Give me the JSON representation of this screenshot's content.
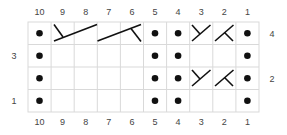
{
  "chart": {
    "type": "knitting-chart",
    "columns": 10,
    "rows": 4,
    "column_labels": [
      "10",
      "9",
      "8",
      "7",
      "6",
      "5",
      "4",
      "3",
      "2",
      "1"
    ],
    "row_labels": {
      "right": [
        {
          "row": 4,
          "label": "4"
        },
        {
          "row": 2,
          "label": "2"
        }
      ],
      "left": [
        {
          "row": 3,
          "label": "3"
        },
        {
          "row": 1,
          "label": "1"
        }
      ]
    },
    "colors": {
      "grid": "#d9d9d9",
      "symbol": "#111111",
      "label": "#444444",
      "background": "#ffffff"
    },
    "symbols": {
      "dot": "purl",
      "empty": "knit",
      "right-twist": "Y-shaped cross over 1 stitch",
      "left-twist": "inverted-Y cross over 1 stitch",
      "cable-left-2": "2-stitch cable, branch upper-left",
      "cable-right-2": "2-stitch cable, branch lower-right"
    },
    "cells": [
      {
        "row": 4,
        "stitches": [
          "dot",
          "cable-left-2:start",
          "cable-left-2:end",
          "cable-right-2:start",
          "cable-right-2:end",
          "dot",
          "dot",
          "right-twist",
          "left-twist",
          "dot"
        ]
      },
      {
        "row": 3,
        "stitches": [
          "dot",
          "empty",
          "empty",
          "empty",
          "empty",
          "dot",
          "dot",
          "empty",
          "empty",
          "dot"
        ]
      },
      {
        "row": 2,
        "stitches": [
          "dot",
          "empty",
          "empty",
          "empty",
          "empty",
          "dot",
          "dot",
          "right-twist",
          "left-twist",
          "dot"
        ]
      },
      {
        "row": 1,
        "stitches": [
          "dot",
          "empty",
          "empty",
          "empty",
          "empty",
          "dot",
          "dot",
          "empty",
          "empty",
          "dot"
        ]
      }
    ]
  }
}
